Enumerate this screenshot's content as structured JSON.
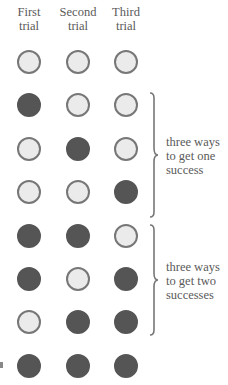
{
  "headers": [
    "First\ntrial",
    "Second\ntrial",
    "Third\ntrial"
  ],
  "header_lines": [
    [
      "First",
      "trial"
    ],
    [
      "Second",
      "trial"
    ],
    [
      "Third",
      "trial"
    ]
  ],
  "colors": {
    "success": "#555555",
    "failure_fill": "#ebebeb",
    "failure_stroke": "#777777"
  },
  "rows": [
    [
      0,
      0,
      0
    ],
    [
      1,
      0,
      0
    ],
    [
      0,
      1,
      0
    ],
    [
      0,
      0,
      1
    ],
    [
      1,
      1,
      0
    ],
    [
      1,
      0,
      1
    ],
    [
      0,
      1,
      1
    ],
    [
      1,
      1,
      1
    ]
  ],
  "groups": [
    {
      "label_lines": [
        "three ways",
        "to get one",
        "success"
      ],
      "rows": [
        1,
        3
      ]
    },
    {
      "label_lines": [
        "three ways",
        "to get two",
        "successes"
      ],
      "rows": [
        4,
        6
      ]
    }
  ]
}
